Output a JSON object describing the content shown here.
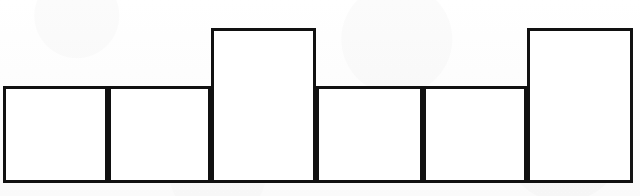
{
  "figure": {
    "title": "",
    "background_color": "#fdfdfd",
    "stroke_color": "#111111",
    "fill_color": "#ffffff",
    "stroke_width_px": 3
  },
  "chart_data": {
    "type": "bar",
    "title": "",
    "subtitle": "",
    "xlabel": "",
    "ylabel": "",
    "categories": [
      "1",
      "2",
      "3",
      "4",
      "5",
      "6"
    ],
    "values": [
      97,
      97,
      155,
      97,
      97,
      155
    ],
    "value_labels": [
      "",
      "",
      "",
      "",
      "",
      ""
    ],
    "tick_labels": [],
    "legend": [],
    "legend_position": "none",
    "grid": false,
    "xlim": [
      3,
      633
    ],
    "ylim": [
      0,
      196
    ],
    "bar_edges_px": [
      3,
      108,
      211,
      316,
      423,
      527,
      633
    ],
    "baseline_y_px": 183,
    "low_top_y_px": 86,
    "tall_top_y_px": 28,
    "annotations": []
  },
  "bars": [
    {
      "name": "bar-1",
      "x": 3,
      "width": 105,
      "top": 86,
      "height": 97,
      "level": "low"
    },
    {
      "name": "bar-2",
      "x": 108,
      "width": 103,
      "top": 86,
      "height": 97,
      "level": "low"
    },
    {
      "name": "bar-3",
      "x": 211,
      "width": 105,
      "top": 28,
      "height": 155,
      "level": "tall"
    },
    {
      "name": "bar-4",
      "x": 316,
      "width": 107,
      "top": 86,
      "height": 97,
      "level": "low"
    },
    {
      "name": "bar-5",
      "x": 423,
      "width": 104,
      "top": 86,
      "height": 97,
      "level": "low"
    },
    {
      "name": "bar-6",
      "x": 527,
      "width": 106,
      "top": 28,
      "height": 155,
      "level": "tall"
    }
  ]
}
